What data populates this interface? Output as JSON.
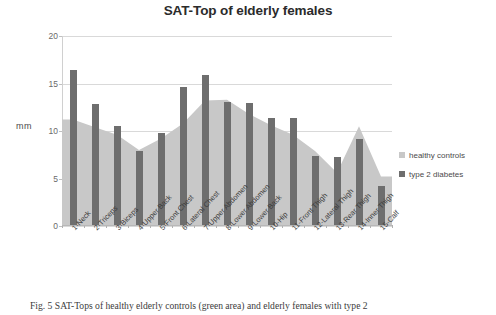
{
  "figure": {
    "caption": "Fig. 5 SAT-Tops of healthy elderly controls (green area) and elderly females with type 2"
  },
  "legend": {
    "position": "right",
    "items": [
      {
        "label": "healthy controls",
        "color": "#c8c8c8"
      },
      {
        "label": "type 2 diabetes",
        "color": "#6e6e6e"
      }
    ]
  },
  "chart_data": {
    "type": "bar",
    "title": "SAT-Top of elderly females",
    "xlabel": "",
    "ylabel": "mm",
    "ylim": [
      0,
      20
    ],
    "yticks": [
      0,
      5,
      10,
      15,
      20
    ],
    "ytick_labels": [
      "0",
      "5",
      "10",
      "15",
      "20"
    ],
    "grid": true,
    "categories": [
      "1-Neck",
      "2-Triceps",
      "3-Biceps",
      "4-Upper Back",
      "5-Front Chest",
      "6-Lateral Chest",
      "7-Upper Abdomen",
      "8-Lower Abdomen",
      "9-Lower Back",
      "10-Hip",
      "11-Front Thigh",
      "12-Lateral Thigh",
      "13-Rear Thigh",
      "14-Inner Thigh",
      "15-Calf"
    ],
    "series": [
      {
        "name": "healthy controls",
        "type": "area",
        "color": "#c8c8c8",
        "values": [
          11.2,
          10.4,
          9.6,
          8.0,
          9.2,
          10.8,
          13.2,
          13.3,
          11.8,
          10.6,
          9.6,
          7.9,
          5.6,
          10.5,
          5.2
        ]
      },
      {
        "name": "type 2 diabetes",
        "type": "bar",
        "color": "#6e6e6e",
        "values": [
          16.4,
          12.8,
          10.5,
          7.9,
          9.8,
          14.6,
          15.9,
          13.1,
          12.9,
          11.4,
          11.4,
          7.4,
          7.3,
          9.2,
          4.2
        ]
      }
    ]
  }
}
